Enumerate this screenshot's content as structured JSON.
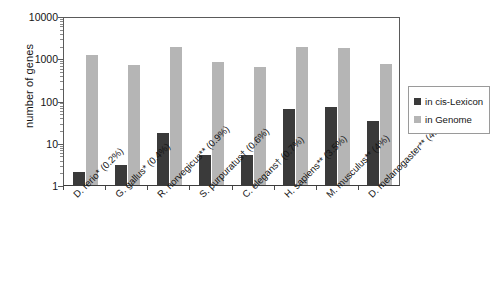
{
  "chart_data": {
    "type": "bar",
    "title": "",
    "xlabel": "",
    "ylabel": "number of genes",
    "yscale": "log",
    "ylim": [
      1,
      10000
    ],
    "ytick_labels": [
      "1",
      "10",
      "100",
      "1000",
      "10000"
    ],
    "ytick_values": [
      1,
      10,
      100,
      1000,
      10000
    ],
    "grid": false,
    "legend_position": "right",
    "categories": [
      "D. rerio* (0.2%)",
      "G. gallus* (0.4%)",
      "R. norvegicus** (0.9%)",
      "S. purpuratus† (0.6%)",
      "C. elegans† (0.7%)",
      "H. sapiens** (3.5%)",
      "M. musculus** (4%)",
      "D. melanogaster** (4.2%)"
    ],
    "series": [
      {
        "name": "in cis-Lexicon",
        "color": "#3a3a3a",
        "values": [
          2,
          3,
          17,
          5,
          5,
          62,
          70,
          32
        ]
      },
      {
        "name": "in Genome",
        "color": "#b5b5b5",
        "values": [
          1200,
          700,
          1800,
          800,
          620,
          1800,
          1750,
          750
        ]
      }
    ]
  },
  "axis": {
    "y_title": "number of genes"
  },
  "legend": {
    "items": [
      {
        "label": "in cis-Lexicon",
        "color": "#3a3a3a"
      },
      {
        "label": "in Genome",
        "color": "#b5b5b5"
      }
    ]
  }
}
